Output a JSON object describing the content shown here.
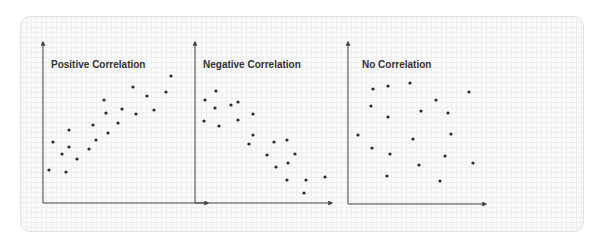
{
  "colors": {
    "axis": "#444444",
    "point": "#2b2b2b",
    "title": "#333333",
    "card_border": "#e2e2e2",
    "card_bg": "#fafafa"
  },
  "chart_data": [
    {
      "type": "scatter",
      "title": "Positive Correlation",
      "xlabel": "",
      "ylabel": "",
      "grid": false,
      "axes": {
        "origin": [
          43,
          203
        ],
        "x_end": 208,
        "y_end": 42
      },
      "points": [
        [
          49,
          170
        ],
        [
          53,
          142
        ],
        [
          62,
          154
        ],
        [
          66,
          172
        ],
        [
          69,
          130
        ],
        [
          69,
          147
        ],
        [
          77,
          159
        ],
        [
          89,
          149
        ],
        [
          93,
          125
        ],
        [
          96,
          140
        ],
        [
          104,
          100
        ],
        [
          106,
          113
        ],
        [
          108,
          133
        ],
        [
          118,
          123
        ],
        [
          122,
          109
        ],
        [
          133,
          87
        ],
        [
          136,
          114
        ],
        [
          147,
          96
        ],
        [
          154,
          110
        ],
        [
          166,
          92
        ],
        [
          171,
          76
        ]
      ]
    },
    {
      "type": "scatter",
      "title": "Negative Correlation",
      "xlabel": "",
      "ylabel": "",
      "grid": false,
      "axes": {
        "origin": [
          195,
          203
        ],
        "x_end": 332,
        "y_end": 42
      },
      "points": [
        [
          205,
          100
        ],
        [
          216,
          91
        ],
        [
          204,
          121
        ],
        [
          215,
          108
        ],
        [
          219,
          126
        ],
        [
          231,
          105
        ],
        [
          238,
          102
        ],
        [
          238,
          120
        ],
        [
          253,
          114
        ],
        [
          253,
          135
        ],
        [
          249,
          144
        ],
        [
          274,
          142
        ],
        [
          287,
          140
        ],
        [
          267,
          155
        ],
        [
          295,
          154
        ],
        [
          276,
          167
        ],
        [
          288,
          163
        ],
        [
          287,
          180
        ],
        [
          306,
          180
        ],
        [
          304,
          193
        ],
        [
          325,
          177
        ]
      ]
    },
    {
      "type": "scatter",
      "title": "No Correlation",
      "xlabel": "",
      "ylabel": "",
      "grid": false,
      "axes": {
        "origin": [
          348,
          204
        ],
        "x_end": 486,
        "y_end": 42
      },
      "points": [
        [
          358,
          135
        ],
        [
          373,
          89
        ],
        [
          371,
          106
        ],
        [
          372,
          148
        ],
        [
          388,
          86
        ],
        [
          388,
          117
        ],
        [
          390,
          154
        ],
        [
          387,
          176
        ],
        [
          410,
          83
        ],
        [
          421,
          111
        ],
        [
          413,
          139
        ],
        [
          419,
          165
        ],
        [
          436,
          100
        ],
        [
          448,
          113
        ],
        [
          451,
          134
        ],
        [
          445,
          156
        ],
        [
          440,
          181
        ],
        [
          469,
          92
        ],
        [
          473,
          163
        ]
      ]
    }
  ]
}
